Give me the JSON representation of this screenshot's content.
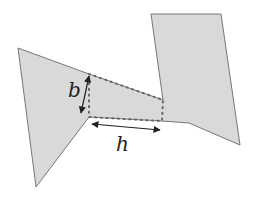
{
  "diagram": {
    "colors": {
      "fill": "#d9d9d9",
      "stroke": "#777777",
      "dots": "#666666",
      "arrow": "#222222",
      "background": "#ffffff"
    },
    "polygon_outline": [
      [
        18,
        48
      ],
      [
        89,
        74
      ],
      [
        163,
        100
      ],
      [
        151,
        14
      ],
      [
        221,
        14
      ],
      [
        240,
        145
      ],
      [
        189,
        123
      ],
      [
        162,
        121
      ],
      [
        89,
        117
      ],
      [
        36,
        187
      ]
    ],
    "dotted_region": [
      [
        89,
        74
      ],
      [
        163,
        100
      ],
      [
        162,
        121
      ],
      [
        89,
        117
      ]
    ],
    "labels": {
      "b": "b",
      "h": "h"
    },
    "arrows": {
      "b": {
        "from": [
          89,
          76
        ],
        "to": [
          81,
          113
        ]
      },
      "h": {
        "from": [
          92,
          124
        ],
        "to": [
          160,
          130
        ]
      }
    }
  }
}
